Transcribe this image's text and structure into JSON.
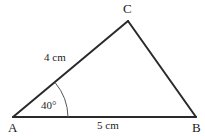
{
  "figure": {
    "type": "triangle-geometry-diagram",
    "background_color": "#ffffff",
    "stroke_color": "#2a2a2a",
    "text_color": "#1c1c1c",
    "width": 205,
    "height": 136,
    "vertices": [
      {
        "name": "A",
        "label": "A",
        "x": 13,
        "y": 117
      },
      {
        "name": "B",
        "label": "B",
        "x": 196,
        "y": 117
      },
      {
        "name": "C",
        "label": "C",
        "x": 128,
        "y": 21
      }
    ],
    "sides": [
      {
        "name": "AC",
        "label": "4 cm",
        "from": "A",
        "to": "C",
        "length_value": 4,
        "unit": "cm"
      },
      {
        "name": "AB",
        "label": "5 cm",
        "from": "A",
        "to": "B",
        "length_value": 5,
        "unit": "cm"
      },
      {
        "name": "CB",
        "label": "",
        "from": "C",
        "to": "B"
      }
    ],
    "angles": [
      {
        "name": "angle-A",
        "at": "A",
        "label": "40°",
        "value": 40,
        "unit": "degrees",
        "arc_radius": 55
      }
    ]
  }
}
